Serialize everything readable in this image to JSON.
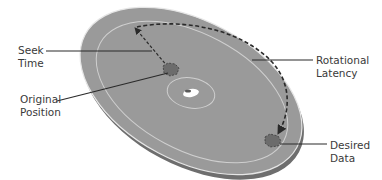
{
  "diagram": {
    "type": "hard-disk-platter-access-time",
    "colors": {
      "background": "#ffffff",
      "platter_surface": "#9a9a9a",
      "platter_edge": "#6e6e6e",
      "platter_rim_highlight": "#e6e6e6",
      "track_line": "#cfcfcf",
      "dashed_path": "#2a2a2a",
      "callout_line": "#2a2a2a",
      "data_block": "#6c6c6c",
      "label_text": "#3a3a3a"
    },
    "labels": {
      "seek_time": {
        "line1": "Seek",
        "line2": "Time"
      },
      "original_position": {
        "line1": "Original",
        "line2": "Position"
      },
      "rotational_latency": {
        "line1": "Rotational",
        "line2": "Latency"
      },
      "desired_data": {
        "line1": "Desired",
        "line2": "Data"
      }
    }
  }
}
